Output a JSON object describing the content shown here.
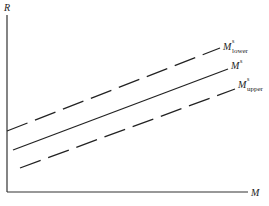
{
  "diagram": {
    "y_axis_label": "R",
    "x_axis_label": "M",
    "lines": [
      {
        "name": "M^s_lower",
        "base": "M",
        "sup": "s",
        "sub": "lower",
        "style": "dashed"
      },
      {
        "name": "M^s",
        "base": "M",
        "sup": "s",
        "sub": "",
        "style": "solid"
      },
      {
        "name": "M^s_upper",
        "base": "M",
        "sup": "s",
        "sub": "upper",
        "style": "dashed"
      }
    ],
    "colors": {
      "line": "#222222",
      "background": "#ffffff"
    }
  }
}
